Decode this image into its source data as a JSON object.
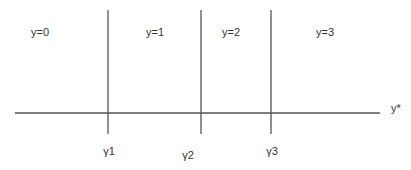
{
  "diagram": {
    "region_labels": [
      "y=0",
      "y=1",
      "y=2",
      "y=3"
    ],
    "threshold_labels": [
      "γ1",
      "γ2",
      "γ3"
    ],
    "axis_label": "y*",
    "line_color": "#555555",
    "text_color": "#333333"
  }
}
